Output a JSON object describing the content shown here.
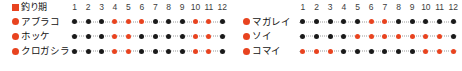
{
  "chart_data": {
    "type": "heatmap",
    "title": "釣り期",
    "xlabel": "",
    "ylabel": "",
    "categories": [
      "1",
      "2",
      "3",
      "4",
      "5",
      "6",
      "7",
      "8",
      "9",
      "10",
      "11",
      "12"
    ],
    "legend": {
      "label": "釣り期",
      "marker": "square-marker",
      "active_color": "#e8431f",
      "inactive_color": "#1a1a1a"
    },
    "colors": {
      "active": "#e8431f",
      "inactive": "#1a1a1a",
      "text": "#111111",
      "line": "#9a9a9a",
      "background": "#ffffff"
    },
    "series": [
      {
        "name": "アブラコ",
        "panel": "left",
        "values": [
          0,
          0,
          0,
          1,
          1,
          1,
          0,
          0,
          0,
          1,
          1,
          0
        ]
      },
      {
        "name": "ホッケ",
        "panel": "left",
        "values": [
          0,
          0,
          0,
          1,
          1,
          0,
          0,
          0,
          0,
          1,
          1,
          0
        ]
      },
      {
        "name": "クロガシラ",
        "panel": "left",
        "values": [
          0,
          0,
          0,
          1,
          1,
          0,
          0,
          0,
          0,
          1,
          1,
          0
        ]
      },
      {
        "name": "マガレイ",
        "panel": "right",
        "values": [
          0,
          0,
          0,
          0,
          0,
          1,
          1,
          0,
          0,
          0,
          0,
          0
        ]
      },
      {
        "name": "ソイ",
        "panel": "right",
        "values": [
          0,
          0,
          0,
          0,
          1,
          1,
          1,
          1,
          1,
          1,
          1,
          0
        ]
      },
      {
        "name": "コマイ",
        "panel": "right",
        "values": [
          1,
          1,
          1,
          0,
          0,
          0,
          0,
          0,
          0,
          1,
          1,
          1
        ]
      }
    ]
  },
  "left_panel": {
    "header": {
      "legend_label": "釣り期",
      "months": [
        "1",
        "2",
        "3",
        "4",
        "5",
        "6",
        "7",
        "8",
        "9",
        "10",
        "11",
        "12"
      ]
    },
    "rows": [
      {
        "label": "アブラコ"
      },
      {
        "label": "ホッケ"
      },
      {
        "label": "クロガシラ"
      }
    ]
  },
  "right_panel": {
    "header": {
      "months": [
        "1",
        "2",
        "3",
        "4",
        "5",
        "6",
        "7",
        "8",
        "9",
        "10",
        "11",
        "12"
      ]
    },
    "rows": [
      {
        "label": "マガレイ"
      },
      {
        "label": "ソイ"
      },
      {
        "label": "コマイ"
      }
    ]
  }
}
